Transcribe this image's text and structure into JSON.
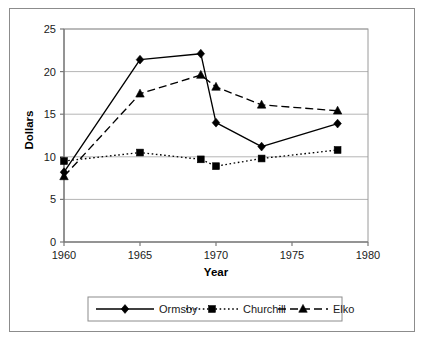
{
  "chart_data": {
    "type": "line",
    "title": "",
    "xlabel": "Year",
    "ylabel": "Dollars",
    "xlim": [
      1960,
      1980
    ],
    "ylim": [
      0,
      25
    ],
    "xticks": [
      1960,
      1965,
      1970,
      1975,
      1980
    ],
    "yticks": [
      0,
      5,
      10,
      15,
      20,
      25
    ],
    "grid": "horizontal",
    "legend_position": "bottom",
    "x": [
      1960,
      1965,
      1969,
      1970,
      1973,
      1978
    ],
    "series": [
      {
        "name": "Ormsby",
        "values": [
          8.2,
          21.4,
          22.1,
          14.0,
          11.2,
          13.9
        ],
        "marker": "diamond",
        "line_style": "solid",
        "color": "#000000"
      },
      {
        "name": "Churchill",
        "values": [
          9.5,
          10.5,
          9.7,
          8.9,
          9.8,
          10.8
        ],
        "marker": "square",
        "line_style": "dotted",
        "color": "#000000"
      },
      {
        "name": "Elko",
        "values": [
          7.7,
          17.4,
          19.6,
          18.2,
          16.1,
          15.4
        ],
        "marker": "triangle",
        "line_style": "dashed",
        "color": "#000000"
      }
    ]
  },
  "axis": {
    "y_tick_labels": [
      "0",
      "5",
      "10",
      "15",
      "20",
      "25"
    ],
    "x_tick_labels": [
      "1960",
      "1965",
      "1970",
      "1975",
      "1980"
    ],
    "y_title": "Dollars",
    "x_title": "Year"
  },
  "legend": {
    "items": [
      {
        "label": "Ormsby",
        "marker": "diamond",
        "style": "solid"
      },
      {
        "label": "Churchill",
        "marker": "square",
        "style": "dotted"
      },
      {
        "label": "Elko",
        "marker": "triangle",
        "style": "dashed"
      }
    ]
  },
  "colors": {
    "ink": "#000000",
    "grid": "#b5b5b5",
    "axis": "#7a7a7a",
    "frame": "#8c8c8c",
    "background": "#ffffff"
  }
}
